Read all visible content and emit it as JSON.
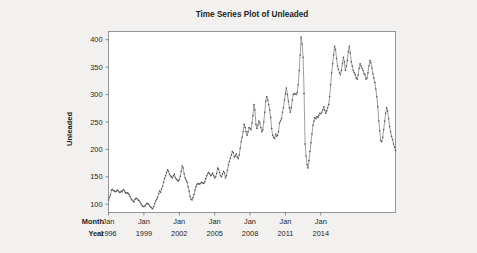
{
  "background_color": "#f2f1ef",
  "plot_background_color": "#ffffff",
  "series_color": "#6b6b6b",
  "axis_color": "#8a8a8a",
  "header": {
    "title": "Time Series Plot of Unleaded"
  },
  "axis_row_labels": {
    "month": "Month",
    "year": "Year"
  },
  "chart_data": {
    "type": "line",
    "title": "Time Series Plot of Unleaded",
    "xlabel": "",
    "ylabel": "Unleaded",
    "ylim": [
      85,
      415
    ],
    "yticks": [
      100,
      150,
      200,
      250,
      300,
      350,
      400
    ],
    "ytick_labels": [
      "100",
      "150",
      "200",
      "250",
      "300",
      "350",
      "400"
    ],
    "grid": false,
    "legend": false,
    "markers": true,
    "x_axis_style": "two-row month/year",
    "x_tick_indices": [
      0,
      36,
      72,
      108,
      144,
      180,
      216
    ],
    "x_tick_month_labels": [
      "Jan",
      "Jan",
      "Jan",
      "Jan",
      "Jan",
      "Jan",
      "Jan"
    ],
    "x_tick_year_labels": [
      "1996",
      "1999",
      "2002",
      "2005",
      "2008",
      "2011",
      "2014"
    ],
    "x_start": "Jan 1996",
    "x_end": "Oct 2015",
    "n_points": 238,
    "values": [
      108,
      113,
      117,
      126,
      127,
      125,
      124,
      123,
      124,
      126,
      124,
      122,
      122,
      124,
      123,
      127,
      125,
      122,
      120,
      121,
      120,
      118,
      114,
      110,
      108,
      106,
      104,
      109,
      111,
      110,
      108,
      107,
      104,
      101,
      98,
      96,
      96,
      97,
      99,
      102,
      101,
      100,
      97,
      95,
      93,
      92,
      96,
      101,
      106,
      109,
      113,
      119,
      124,
      122,
      128,
      133,
      140,
      147,
      152,
      158,
      163,
      160,
      155,
      152,
      150,
      148,
      152,
      155,
      149,
      146,
      144,
      142,
      145,
      151,
      160,
      170,
      166,
      155,
      148,
      144,
      140,
      132,
      124,
      114,
      109,
      108,
      112,
      118,
      126,
      132,
      136,
      138,
      137,
      137,
      139,
      140,
      139,
      138,
      141,
      147,
      152,
      156,
      158,
      155,
      152,
      154,
      157,
      152,
      148,
      150,
      156,
      166,
      164,
      158,
      152,
      150,
      155,
      160,
      157,
      148,
      152,
      162,
      172,
      178,
      184,
      190,
      196,
      194,
      186,
      188,
      192,
      186,
      183,
      190,
      202,
      214,
      222,
      232,
      246,
      240,
      232,
      226,
      232,
      240,
      238,
      236,
      248,
      262,
      282,
      272,
      246,
      238,
      244,
      252,
      248,
      240,
      232,
      236,
      250,
      268,
      288,
      296,
      290,
      282,
      272,
      258,
      238,
      226,
      222,
      220,
      228,
      224,
      226,
      232,
      248,
      252,
      256,
      268,
      276,
      290,
      302,
      312,
      300,
      288,
      276,
      268,
      276,
      290,
      300,
      302,
      301,
      300,
      304,
      318,
      344,
      372,
      405,
      392,
      368,
      302,
      210,
      188,
      172,
      166,
      180,
      196,
      212,
      228,
      244,
      252,
      258,
      256,
      260,
      258,
      262,
      266,
      265,
      268,
      272,
      278,
      272,
      266,
      270,
      276,
      282,
      296,
      318,
      340,
      356,
      372,
      388,
      382,
      366,
      352,
      346,
      340,
      336,
      344,
      356,
      368,
      360,
      344,
      352,
      362,
      378,
      388,
      376,
      360,
      352,
      344,
      340,
      336,
      330,
      328,
      336,
      348,
      356,
      352,
      348,
      344,
      338,
      336,
      328,
      330,
      340,
      352,
      362,
      358,
      348,
      338,
      330,
      322,
      310,
      296,
      278,
      252,
      234,
      216,
      214,
      222,
      236,
      252,
      266,
      276,
      270,
      256,
      242,
      232,
      224,
      218,
      210,
      204,
      198
    ]
  }
}
